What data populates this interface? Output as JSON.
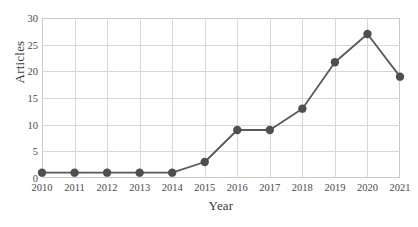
{
  "chart_data": {
    "type": "line",
    "title": "",
    "xlabel": "Year",
    "ylabel": "Articles",
    "categories": [
      "2010",
      "2011",
      "2012",
      "2013",
      "2014",
      "2015",
      "2016",
      "2017",
      "2018",
      "2019",
      "2020",
      "2021"
    ],
    "x": [
      2010,
      2011,
      2012,
      2013,
      2014,
      2015,
      2016,
      2017,
      2018,
      2019,
      2020,
      2021
    ],
    "values": [
      1,
      1,
      1,
      1,
      1,
      3,
      9,
      9,
      13,
      21.7,
      27,
      19
    ],
    "series": [
      {
        "name": "Articles",
        "values": [
          1,
          1,
          1,
          1,
          1,
          3,
          9,
          9,
          13,
          21.7,
          27,
          19
        ]
      }
    ],
    "xlim": [
      2010,
      2021
    ],
    "ylim": [
      0,
      30
    ],
    "yticks": [
      0,
      5,
      10,
      15,
      20,
      25,
      30
    ],
    "xticks": [
      "2010",
      "2011",
      "2012",
      "2013",
      "2014",
      "2015",
      "2016",
      "2017",
      "2018",
      "2019",
      "2020",
      "2021"
    ],
    "ytick_labels": [
      "0",
      "5",
      "10",
      "15",
      "20",
      "25",
      "30"
    ],
    "grid": true,
    "legend": false,
    "legend_position": "none",
    "marker": "circle",
    "line_color": "#595959",
    "marker_color": "#4f4f4f",
    "grid_color": "#d7d7da",
    "frame_color": "#c9c9cc",
    "background_color": "#ffffff",
    "text_color": "#4a4a4a"
  }
}
